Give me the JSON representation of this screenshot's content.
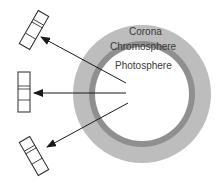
{
  "diagram": {
    "title": "",
    "layers": [
      {
        "name": "Corona",
        "color": "#bdbdbd"
      },
      {
        "name": "Chromosphere",
        "color": "#8e8e8e"
      },
      {
        "name": "Photosphere",
        "color": "#ffffff"
      }
    ],
    "labels": {
      "corona": "Corona",
      "chromosphere": "Chromosphere",
      "photosphere": "Photosphere"
    },
    "arrows": [
      {
        "direction": "upper-left",
        "target": "spectrum-strip-top"
      },
      {
        "direction": "left",
        "target": "spectrum-strip-middle"
      },
      {
        "direction": "lower-left",
        "target": "spectrum-strip-bottom"
      }
    ],
    "spectra": [
      {
        "position": "top",
        "lines": 2
      },
      {
        "position": "middle",
        "lines": 2
      },
      {
        "position": "bottom",
        "lines": 2
      }
    ]
  }
}
